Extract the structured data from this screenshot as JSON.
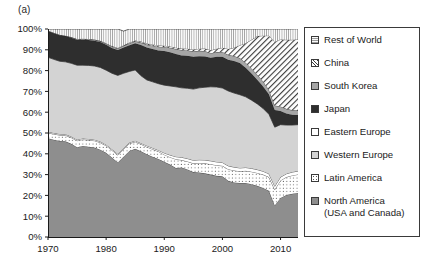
{
  "panel": {
    "label": "(a)"
  },
  "colors": {
    "rest_of_world": "#fbfbfb",
    "china": "#ffffff",
    "south_korea": "#a6a6a6",
    "japan": "#2e2e2e",
    "eastern_europe": "#ffffff",
    "western_europe": "#d3d3d3",
    "latin_america": "#ffffff",
    "north_america": "#8e8e8e",
    "axis": "#1a1a1a",
    "outline": "#2a2a2a"
  },
  "legend": {
    "items": [
      {
        "label": "Rest of World",
        "swatch": "dotted-fine",
        "key": "rest_of_world"
      },
      {
        "label": "China",
        "swatch": "diagonal-hatch",
        "key": "china"
      },
      {
        "label": "South Korea",
        "swatch": "solid-gray",
        "key": "south_korea"
      },
      {
        "label": "Japan",
        "swatch": "solid-dark",
        "key": "japan"
      },
      {
        "label": "Eastern Europe",
        "swatch": "solid-white",
        "key": "eastern_europe"
      },
      {
        "label": "Western Europe",
        "swatch": "solid-light",
        "key": "western_europe"
      },
      {
        "label": "Latin America",
        "swatch": "dotted-sparse",
        "key": "latin_america"
      },
      {
        "label": "North America\n(USA and Canada)",
        "swatch": "solid-midgray",
        "key": "north_america"
      }
    ]
  },
  "chart_data": {
    "type": "area",
    "stacked": true,
    "normalized": true,
    "title": "",
    "xlabel": "",
    "ylabel": "",
    "xlim": [
      1970,
      2013
    ],
    "ylim": [
      0,
      100
    ],
    "grid": false,
    "legend_position": "right",
    "xticks": [
      1970,
      1980,
      1990,
      2000,
      2010
    ],
    "xtick_labels": [
      "1970",
      "1980",
      "1990",
      "2000",
      "2010"
    ],
    "yticks": [
      0,
      10,
      20,
      30,
      40,
      50,
      60,
      70,
      80,
      90,
      100
    ],
    "ytick_labels": [
      "0%",
      "10%",
      "20%",
      "30%",
      "40%",
      "50%",
      "60%",
      "70%",
      "80%",
      "90%",
      "100%"
    ],
    "x": [
      1970,
      1971,
      1972,
      1973,
      1974,
      1975,
      1976,
      1977,
      1978,
      1979,
      1980,
      1981,
      1982,
      1983,
      1984,
      1985,
      1986,
      1987,
      1988,
      1989,
      1990,
      1991,
      1992,
      1993,
      1994,
      1995,
      1996,
      1997,
      1998,
      1999,
      2000,
      2001,
      2002,
      2003,
      2004,
      2005,
      2006,
      2007,
      2008,
      2009,
      2010,
      2011,
      2012,
      2013
    ],
    "series": [
      {
        "name": "North America (USA and Canada)",
        "values": [
          47.5,
          46.8,
          46.2,
          46.0,
          44.8,
          43.2,
          43.8,
          43.4,
          43.0,
          42.0,
          40.5,
          38.2,
          35.8,
          38.6,
          41.4,
          42.4,
          41.2,
          39.8,
          38.6,
          37.5,
          36.2,
          34.8,
          33.2,
          33.4,
          32.5,
          31.2,
          31.0,
          30.6,
          30.0,
          29.4,
          29.2,
          27.0,
          26.2,
          26.0,
          26.0,
          25.4,
          24.6,
          23.6,
          22.2,
          15.2,
          18.8,
          20.2,
          20.8,
          21.2
        ]
      },
      {
        "name": "Latin America",
        "values": [
          2.6,
          2.7,
          2.8,
          2.9,
          3.0,
          3.1,
          3.1,
          3.2,
          3.3,
          3.4,
          3.4,
          3.5,
          3.6,
          3.6,
          3.5,
          3.4,
          3.4,
          3.5,
          3.6,
          3.6,
          3.4,
          3.6,
          4.2,
          3.6,
          3.8,
          4.2,
          4.6,
          4.8,
          5.0,
          5.1,
          5.0,
          5.6,
          5.8,
          5.6,
          5.8,
          6.0,
          6.2,
          6.4,
          6.6,
          7.6,
          8.4,
          8.6,
          8.8,
          8.9
        ]
      },
      {
        "name": "Eastern Europe",
        "values": [
          0.5,
          0.5,
          0.5,
          0.5,
          0.5,
          0.5,
          0.5,
          0.5,
          0.5,
          0.5,
          0.5,
          0.5,
          0.5,
          0.5,
          0.5,
          0.5,
          0.5,
          0.6,
          0.6,
          0.6,
          0.8,
          1.0,
          1.2,
          1.3,
          1.4,
          1.5,
          1.5,
          1.6,
          1.6,
          1.6,
          1.6,
          1.6,
          1.6,
          1.6,
          1.6,
          1.6,
          1.6,
          1.6,
          1.6,
          1.6,
          1.6,
          1.6,
          1.6,
          1.6
        ]
      },
      {
        "name": "Western Europe",
        "values": [
          35.8,
          35.4,
          35.0,
          34.8,
          35.2,
          35.8,
          35.2,
          35.4,
          35.4,
          35.6,
          35.8,
          36.5,
          37.8,
          36.0,
          34.2,
          34.0,
          32.4,
          31.6,
          31.8,
          32.0,
          32.6,
          33.2,
          33.6,
          33.4,
          33.8,
          34.2,
          34.6,
          35.0,
          35.6,
          36.0,
          35.8,
          36.0,
          35.6,
          35.2,
          34.0,
          32.8,
          31.6,
          30.2,
          28.6,
          28.4,
          25.2,
          23.4,
          22.6,
          22.3
        ]
      },
      {
        "name": "Japan",
        "values": [
          12.6,
          12.6,
          12.5,
          12.4,
          12.3,
          12.2,
          12.2,
          12.2,
          12.2,
          12.2,
          12.2,
          12.2,
          12.2,
          12.4,
          12.6,
          12.8,
          14.8,
          15.6,
          15.8,
          16.0,
          16.4,
          16.2,
          15.8,
          15.6,
          15.6,
          15.6,
          15.2,
          14.8,
          14.0,
          14.6,
          15.0,
          15.0,
          15.4,
          15.2,
          14.0,
          12.8,
          11.6,
          10.6,
          9.6,
          8.2,
          6.6,
          5.6,
          5.0,
          4.6
        ]
      },
      {
        "name": "South Korea",
        "values": [
          0.1,
          0.1,
          0.1,
          0.1,
          0.2,
          0.2,
          0.3,
          0.3,
          0.4,
          0.4,
          0.5,
          0.6,
          0.7,
          0.8,
          0.9,
          1.0,
          1.2,
          1.4,
          1.6,
          1.8,
          2.0,
          2.2,
          2.4,
          2.6,
          2.6,
          2.6,
          2.6,
          2.6,
          2.2,
          2.2,
          2.4,
          2.4,
          2.4,
          2.4,
          2.4,
          2.4,
          2.4,
          2.4,
          2.2,
          2.2,
          2.2,
          2.2,
          2.2,
          2.2
        ]
      },
      {
        "name": "China",
        "values": [
          0.1,
          0.1,
          0.1,
          0.1,
          0.1,
          0.2,
          0.2,
          0.2,
          0.2,
          0.2,
          0.3,
          0.3,
          0.3,
          0.3,
          0.4,
          0.4,
          0.5,
          0.5,
          0.6,
          0.6,
          0.6,
          0.6,
          0.6,
          0.7,
          0.8,
          0.9,
          1.0,
          1.2,
          1.4,
          1.6,
          2.0,
          2.8,
          4.0,
          6.2,
          9.4,
          13.8,
          18.6,
          22.0,
          26.0,
          30.6,
          32.2,
          33.2,
          33.8,
          34.2
        ]
      },
      {
        "name": "Rest of World",
        "values": [
          0.8,
          1.8,
          2.8,
          3.2,
          3.9,
          4.8,
          4.7,
          4.8,
          5.0,
          5.7,
          6.8,
          8.2,
          9.1,
          6.8,
          6.5,
          5.5,
          6.0,
          7.0,
          7.4,
          7.9,
          8.0,
          8.4,
          9.0,
          9.4,
          9.5,
          9.8,
          9.5,
          9.4,
          10.2,
          9.5,
          9.0,
          9.6,
          9.0,
          7.8,
          6.8,
          5.2,
          3.4,
          3.2,
          3.2,
          6.2,
          5.0,
          5.2,
          5.2,
          5.1
        ]
      }
    ]
  }
}
